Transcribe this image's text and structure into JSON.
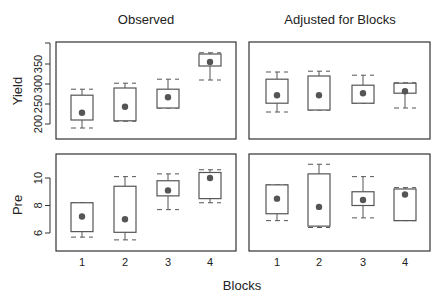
{
  "chart_data": [
    {
      "type": "boxplot",
      "title": "Observed",
      "ylabel": "Yield",
      "xlabel": "",
      "categories": [
        "1",
        "2",
        "3",
        "4"
      ],
      "yticks": [
        200,
        250,
        300,
        350
      ],
      "ylim": [
        175,
        400
      ],
      "boxes": [
        {
          "block": "1",
          "whisker_low": 190,
          "q1": 210,
          "q3": 272,
          "whisker_high": 287,
          "mean": 228
        },
        {
          "block": "2",
          "whisker_low": 207,
          "q1": 208,
          "q3": 290,
          "whisker_high": 302,
          "mean": 243
        },
        {
          "block": "3",
          "whisker_low": 240,
          "q1": 240,
          "q3": 287,
          "whisker_high": 312,
          "mean": 267
        },
        {
          "block": "4",
          "whisker_low": 310,
          "q1": 345,
          "q3": 375,
          "whisker_high": 378,
          "mean": 355
        }
      ]
    },
    {
      "type": "boxplot",
      "title": "Adjusted for Blocks",
      "ylabel": "",
      "xlabel": "",
      "categories": [
        "1",
        "2",
        "3",
        "4"
      ],
      "yticks": [],
      "ylim": [
        175,
        400
      ],
      "boxes": [
        {
          "block": "1",
          "whisker_low": 230,
          "q1": 252,
          "q3": 312,
          "whisker_high": 330,
          "mean": 272
        },
        {
          "block": "2",
          "whisker_low": 235,
          "q1": 235,
          "q3": 320,
          "whisker_high": 332,
          "mean": 272
        },
        {
          "block": "3",
          "whisker_low": 252,
          "q1": 252,
          "q3": 297,
          "whisker_high": 322,
          "mean": 277
        },
        {
          "block": "4",
          "whisker_low": 240,
          "q1": 277,
          "q3": 302,
          "whisker_high": 303,
          "mean": 282
        }
      ]
    },
    {
      "type": "boxplot",
      "title": "",
      "ylabel": "Pre",
      "xlabel": "Blocks",
      "categories": [
        "1",
        "2",
        "3",
        "4"
      ],
      "yticks": [
        6,
        8,
        10
      ],
      "ylim": [
        4.7,
        11.8
      ],
      "boxes": [
        {
          "block": "1",
          "whisker_low": 5.7,
          "q1": 6.1,
          "q3": 8.2,
          "whisker_high": 8.2,
          "mean": 7.2
        },
        {
          "block": "2",
          "whisker_low": 5.5,
          "q1": 6.05,
          "q3": 9.4,
          "whisker_high": 10.1,
          "mean": 7.0
        },
        {
          "block": "3",
          "whisker_low": 7.7,
          "q1": 8.7,
          "q3": 9.8,
          "whisker_high": 10.3,
          "mean": 9.1
        },
        {
          "block": "4",
          "whisker_low": 8.2,
          "q1": 8.5,
          "q3": 10.4,
          "whisker_high": 10.6,
          "mean": 10.0
        }
      ]
    },
    {
      "type": "boxplot",
      "title": "",
      "ylabel": "",
      "xlabel": "Blocks",
      "categories": [
        "1",
        "2",
        "3",
        "4"
      ],
      "yticks": [],
      "ylim": [
        4.7,
        11.8
      ],
      "boxes": [
        {
          "block": "1",
          "whisker_low": 6.9,
          "q1": 7.4,
          "q3": 9.5,
          "whisker_high": 9.5,
          "mean": 8.5
        },
        {
          "block": "2",
          "whisker_low": 6.4,
          "q1": 6.5,
          "q3": 10.3,
          "whisker_high": 11.0,
          "mean": 7.9
        },
        {
          "block": "3",
          "whisker_low": 7.1,
          "q1": 8.0,
          "q3": 9.0,
          "whisker_high": 10.1,
          "mean": 8.4
        },
        {
          "block": "4",
          "whisker_low": 6.9,
          "q1": 6.9,
          "q3": 9.2,
          "whisker_high": 9.3,
          "mean": 8.8
        }
      ]
    }
  ],
  "labels": {
    "title_left": "Observed",
    "title_right": "Adjusted for Blocks",
    "ylabel_top": "Yield",
    "ylabel_bottom": "Pre",
    "xlabel": "Blocks"
  },
  "colors": {
    "axis": "#333333",
    "box": "#555555",
    "mean_point": "#555555"
  }
}
